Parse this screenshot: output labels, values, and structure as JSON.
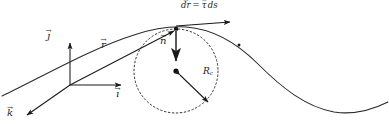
{
  "figure": {
    "background": "#ffffff",
    "ink": "#1a1a1a",
    "width": 389,
    "height": 134
  },
  "labels": {
    "tangent_equation": {
      "lhs": "dr",
      "operator": "=",
      "rhs_vec": "τ",
      "rhs_scalar": "ds"
    },
    "basis_j": "ȷ",
    "basis_i": "ı",
    "basis_k": "k",
    "position_vector": "r",
    "normal_vector": "n",
    "radius_symbol": "R",
    "radius_subscript": "c",
    "arrow_overline": "→"
  },
  "geometry": {
    "origin": {
      "x": 70,
      "y": 85
    },
    "tangent_point": {
      "x": 176,
      "y": 29
    },
    "circle_center": {
      "x": 176,
      "y": 71
    },
    "circle_radius": 42,
    "curve_peak": {
      "x": 186,
      "y": 27
    },
    "curve_trough": {
      "x": 341,
      "y": 112
    },
    "j_axis_tip": {
      "x": 70,
      "y": 41
    },
    "i_axis_tip": {
      "x": 123,
      "y": 85
    },
    "k_axis_tip": {
      "x": 24,
      "y": 116
    },
    "normal_arrow_tip": {
      "x": 176,
      "y": 62
    },
    "radius_arrow_tip": {
      "x": 210,
      "y": 104
    },
    "tangent_arrow_tip": {
      "x": 232,
      "y": 22
    }
  },
  "styles": {
    "curve_stroke_width": 1.0,
    "circle_dash": "1.6 2.4",
    "vector_stroke_width": 1.0,
    "normal_stroke_width": 1.8
  }
}
